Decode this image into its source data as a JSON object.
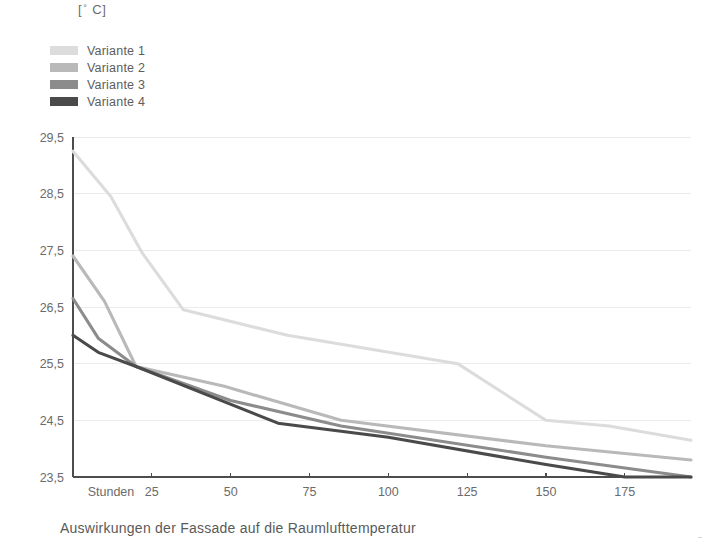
{
  "unit_label": {
    "prefix": "[",
    "degree": "°",
    "suffix": " C]"
  },
  "legend": {
    "items": [
      {
        "label": "Variante 1",
        "color": "#dcdcdc"
      },
      {
        "label": "Variante 2",
        "color": "#b9b9b9"
      },
      {
        "label": "Variante 3",
        "color": "#8c8c8c"
      },
      {
        "label": "Variante 4",
        "color": "#4a4a4a"
      }
    ]
  },
  "caption": "Auswirkungen der Fassade auf die Raumlufttemperatur",
  "chart_data": {
    "type": "line",
    "title": "",
    "subtitle": "",
    "xlabel": "Stunden",
    "ylabel": "[° C]",
    "xlim": [
      0,
      196
    ],
    "ylim": [
      23.5,
      29.5
    ],
    "grid": true,
    "legend_position": "top-left",
    "x_origin_label": "Stunden",
    "xticks": [
      25,
      50,
      75,
      100,
      125,
      150,
      175
    ],
    "xtick_labels": [
      "25",
      "50",
      "75",
      "100",
      "125",
      "150",
      "175"
    ],
    "yticks": [
      23.5,
      24.5,
      25.5,
      26.5,
      27.5,
      28.5,
      29.5
    ],
    "ytick_labels": [
      "23,5",
      "24,5",
      "25,5",
      "26,5",
      "27,5",
      "28,5",
      "29,5"
    ],
    "series": [
      {
        "name": "Variante 1",
        "color": "#dcdcdc",
        "x": [
          0,
          12,
          22,
          35,
          68,
          122,
          150,
          170,
          196
        ],
        "y": [
          29.25,
          28.45,
          27.45,
          26.45,
          26.0,
          25.5,
          24.5,
          24.4,
          24.15
        ]
      },
      {
        "name": "Variante 2",
        "color": "#b9b9b9",
        "x": [
          0,
          10,
          20,
          48,
          85,
          150,
          196
        ],
        "y": [
          27.4,
          26.6,
          25.45,
          25.1,
          24.5,
          24.05,
          23.8
        ]
      },
      {
        "name": "Variante 3",
        "color": "#8c8c8c",
        "x": [
          0,
          8,
          20,
          50,
          85,
          150,
          196
        ],
        "y": [
          26.65,
          25.95,
          25.45,
          24.85,
          24.4,
          23.85,
          23.5
        ]
      },
      {
        "name": "Variante 4",
        "color": "#4a4a4a",
        "x": [
          0,
          8,
          20,
          65,
          100,
          150,
          175,
          196
        ],
        "y": [
          26.0,
          25.7,
          25.45,
          24.45,
          24.2,
          23.72,
          23.5,
          23.5
        ]
      }
    ]
  }
}
